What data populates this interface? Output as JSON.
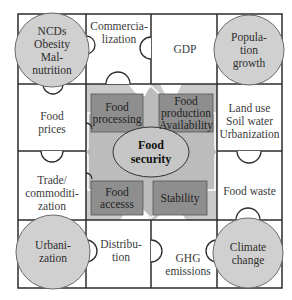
{
  "diagram": {
    "type": "puzzle-grid",
    "center": {
      "title_lines": [
        "Food",
        "security"
      ],
      "pillars": [
        {
          "id": "processing",
          "lines": [
            "Food",
            "processing"
          ]
        },
        {
          "id": "production",
          "lines": [
            "Food",
            "production",
            "Availability"
          ]
        },
        {
          "id": "access",
          "lines": [
            "Food",
            "accesss"
          ]
        },
        {
          "id": "stability",
          "lines": [
            "Stability"
          ]
        }
      ]
    },
    "corners": [
      {
        "id": "ncds",
        "lines": [
          "NCDs",
          "Obesity",
          "Mal-",
          "nutrition"
        ]
      },
      {
        "id": "population",
        "lines": [
          "Popula-",
          "tion",
          "growth"
        ]
      },
      {
        "id": "urbanization",
        "lines": [
          "Urbani-",
          "zation"
        ]
      },
      {
        "id": "climate",
        "lines": [
          "Climate",
          "change"
        ]
      }
    ],
    "tiles": [
      {
        "id": "commercialization",
        "lines": [
          "Commercia-",
          "lization"
        ]
      },
      {
        "id": "gdp",
        "lines": [
          "GDP"
        ]
      },
      {
        "id": "food-prices",
        "lines": [
          "Food",
          "prices"
        ]
      },
      {
        "id": "land-use",
        "lines": [
          "Land use",
          "Soil water",
          "Urbanization"
        ]
      },
      {
        "id": "trade",
        "lines": [
          "Trade/",
          "commoditi-",
          "zation"
        ]
      },
      {
        "id": "food-waste",
        "lines": [
          "Food waste"
        ]
      },
      {
        "id": "distribution",
        "lines": [
          "Distribu-",
          "tion"
        ]
      },
      {
        "id": "ghg",
        "lines": [
          "GHG",
          "emissions"
        ]
      }
    ],
    "colors": {
      "line": "#2b2b2b",
      "center_fill": "#c8c8c8",
      "diamond_fill": "#bdbdbd",
      "box_fill": "#8c8c8c",
      "circle_fill": "#cfcfcf",
      "ellipse_fill": "#c4c4c4"
    }
  }
}
